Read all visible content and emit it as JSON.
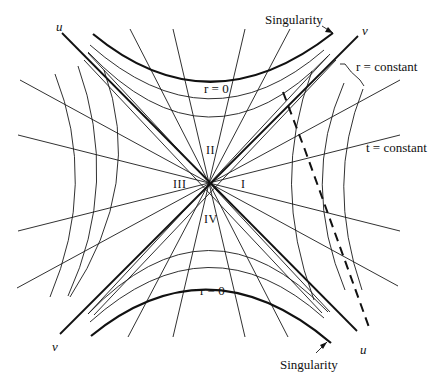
{
  "diagram": {
    "axes": {
      "u_label": "u",
      "v_label": "v"
    },
    "regions": [
      "I",
      "II",
      "III",
      "IV"
    ],
    "annotations": {
      "singularity_top": "Singularity",
      "singularity_bottom": "Singularity",
      "r_constant": "r = constant",
      "t_constant": "t = constant",
      "r_zero_top": "r = 0",
      "r_zero_bottom": "r = 0"
    },
    "labels": {
      "u_top_left": "u",
      "v_top_right": "v",
      "v_bottom_left": "v",
      "u_bottom_right": "u"
    },
    "elements": {
      "horizon_lines": 2,
      "singularity_hyperbolas": 2,
      "r_constant_hyperbolas_per_region": 3,
      "t_constant_radial_lines": 16,
      "infalling_worldline": "dashed"
    }
  }
}
